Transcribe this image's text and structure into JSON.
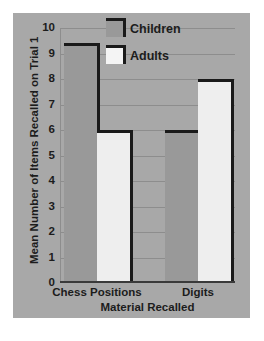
{
  "chart_data": {
    "type": "bar",
    "title": "",
    "xlabel": "Material Recalled",
    "ylabel": "Mean Number of Items Recalled on Trial 1",
    "categories": [
      "Chess Positions",
      "Digits"
    ],
    "series": [
      {
        "name": "Children",
        "values": [
          9.3,
          5.9
        ],
        "color": "#999999"
      },
      {
        "name": "Adults",
        "values": [
          5.9,
          7.9
        ],
        "color": "#eeeeee"
      }
    ],
    "ylim": [
      0,
      10
    ],
    "yticks": [
      0,
      1,
      2,
      3,
      4,
      5,
      6,
      7,
      8,
      9,
      10
    ],
    "ytick_labels": [
      "0",
      "1",
      "2",
      "3",
      "4",
      "5",
      "6",
      "7",
      "8",
      "9",
      "10"
    ],
    "grid": true,
    "legend_position": "top-center",
    "background_color": "#a8a8a8",
    "gridline_color": "#8d8d8d",
    "bar_outline_color": "#1a1a1a"
  },
  "legend": {
    "entries": [
      {
        "label": "Children"
      },
      {
        "label": "Adults"
      }
    ]
  }
}
